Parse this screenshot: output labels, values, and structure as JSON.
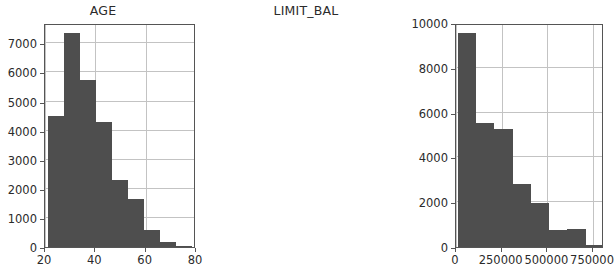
{
  "figure": {
    "background_color": "#ffffff",
    "bar_color": "#4e4e4e",
    "grid_color": "#c3c3c3",
    "axis_color": "#555555",
    "text_color": "#2b2b2b"
  },
  "chart_data": [
    {
      "type": "bar",
      "subplot": "left",
      "title": "AGE",
      "xlabel": "",
      "ylabel": "",
      "grid": true,
      "legend": null,
      "xlim": [
        20,
        80
      ],
      "ylim": [
        0,
        7700
      ],
      "xticks": [
        20,
        40,
        60,
        80
      ],
      "xtick_labels": [
        "20",
        "40",
        "60",
        "80"
      ],
      "yticks": [
        0,
        1000,
        2000,
        3000,
        4000,
        5000,
        6000,
        7000
      ],
      "ytick_labels": [
        "0",
        "1000",
        "2000",
        "3000",
        "4000",
        "5000",
        "6000",
        "7000"
      ],
      "bin_edges": [
        21,
        27.4,
        33.8,
        40.2,
        46.6,
        53,
        59.4,
        65.8,
        72.2,
        78.6
      ],
      "categories": [
        "21-27",
        "27-34",
        "34-40",
        "40-47",
        "47-53",
        "53-59",
        "59-66",
        "66-72",
        "72-79"
      ],
      "values": [
        4500,
        7350,
        5750,
        4300,
        2300,
        1650,
        580,
        180,
        35
      ]
    },
    {
      "type": "bar",
      "subplot": "right",
      "title": "LIMIT_BAL",
      "xlabel": "",
      "ylabel": "",
      "grid": true,
      "legend": null,
      "xlim": [
        0,
        810000
      ],
      "ylim": [
        0,
        10000
      ],
      "xticks": [
        0,
        250000,
        500000,
        750000
      ],
      "xtick_labels": [
        "0",
        "250000",
        "500000",
        "750000"
      ],
      "yticks": [
        0,
        2000,
        4000,
        6000,
        8000,
        10000
      ],
      "ytick_labels": [
        "0",
        "2000",
        "4000",
        "6000",
        "8000",
        "10000"
      ],
      "bin_edges": [
        10000,
        110000,
        210000,
        310000,
        410000,
        510000,
        610000,
        710000,
        810000
      ],
      "categories": [
        "10k-110k",
        "110k-210k",
        "210k-310k",
        "310k-410k",
        "410k-510k",
        "510k-610k",
        "610k-710k",
        "710k-810k"
      ],
      "values": [
        9550,
        5550,
        5250,
        2800,
        1950,
        750,
        800,
        100
      ]
    }
  ]
}
